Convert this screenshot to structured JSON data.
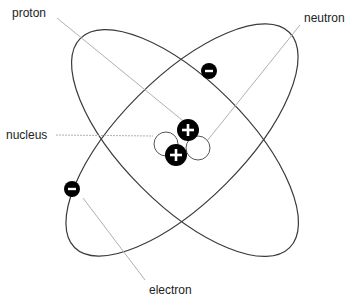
{
  "diagram": {
    "labels": {
      "proton": "proton",
      "neutron": "neutron",
      "nucleus": "nucleus",
      "electron": "electron"
    },
    "symbols": {
      "positive": "+",
      "negative": "−"
    },
    "colors": {
      "orbit": "#3a3a3a",
      "leader": "#b0b0b0",
      "particle": "#000000",
      "particle_sign": "#ffffff"
    }
  }
}
